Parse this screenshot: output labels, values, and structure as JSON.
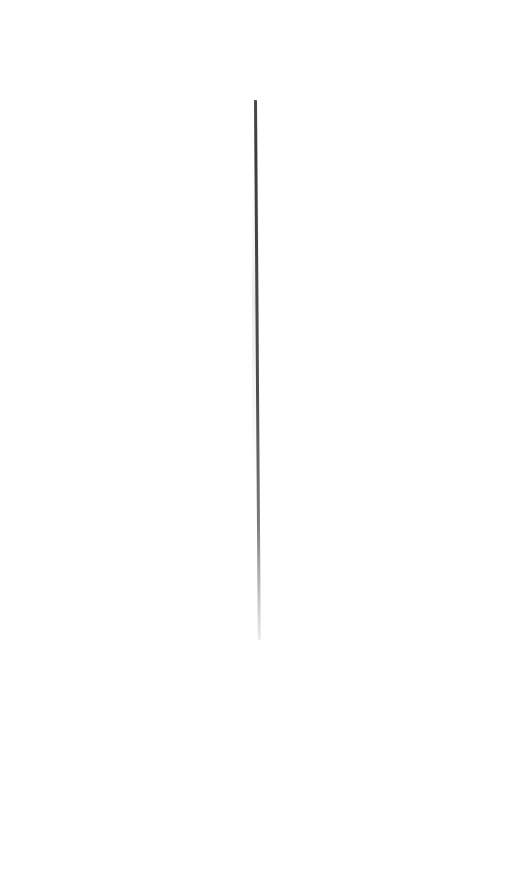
{
  "canvas": {
    "width": 526,
    "height": 884,
    "background": "#ffffff"
  },
  "stroke": {
    "description": "thin vertical dark line fading toward the bottom",
    "color_top": "#3c3c3c",
    "color_bottom": "#ececec",
    "x": 255,
    "y_start": 100,
    "y_end": 640
  }
}
